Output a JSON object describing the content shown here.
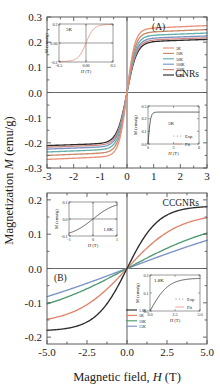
{
  "figure": {
    "xlabel_prefix": "Magnetic field,",
    "xlabel_sym": "H",
    "xlabel_unit": "(T)",
    "ylabel_prefix": "Magnetization",
    "ylabel_sym": "M",
    "ylabel_unit": "(emu/g)"
  },
  "chart_data": [
    {
      "type": "line",
      "panel_label": "(A)",
      "sample_label": "GNRs",
      "xlabel": "Magnetic field, H (T)",
      "ylabel": "Magnetization M (emu/g)",
      "xlim": [
        -3,
        3
      ],
      "ylim": [
        -0.3,
        0.3
      ],
      "xticks": [
        "-3",
        "-2",
        "-1",
        "0",
        "1",
        "2",
        "3"
      ],
      "xtick_values": [
        -3,
        -2,
        -1,
        0,
        1,
        2,
        3
      ],
      "yticks": [
        "0.3",
        "0.2",
        "0.1",
        "0.0",
        "-0.1",
        "-0.2",
        "-0.3"
      ],
      "ytick_values": [
        0.3,
        0.2,
        0.1,
        0.0,
        -0.1,
        -0.2,
        -0.3
      ],
      "grid": false,
      "legend_position": "right-middle",
      "series": [
        {
          "name": "5K",
          "color": "#e8927c",
          "saturation": 0.252,
          "knee": 0.4
        },
        {
          "name": "10K",
          "color": "#c98b6a",
          "saturation": 0.237,
          "knee": 0.42
        },
        {
          "name": "50K",
          "color": "#64b0ac",
          "saturation": 0.224,
          "knee": 0.44
        },
        {
          "name": "100K",
          "color": "#7b93c4",
          "saturation": 0.213,
          "knee": 0.46
        },
        {
          "name": "200K",
          "color": "#d08a84",
          "saturation": 0.206,
          "knee": 0.48
        },
        {
          "name": "300K",
          "color": "#2b2b2b",
          "saturation": 0.2,
          "knee": 0.5
        }
      ],
      "insets": [
        {
          "id": "A-inset-lowfield",
          "type": "line",
          "temperature": "5K",
          "xlabel_sym": "H",
          "xlabel_unit": "(T)",
          "ylabel": "M (emu/g)",
          "xlim": [
            -0.5,
            0.5
          ],
          "ylim": [
            -0.2,
            0.2
          ],
          "xticks": [
            "-0.5",
            "0.00",
            "0.5"
          ],
          "yticks": [
            "0.2",
            "0.00",
            "-0.2"
          ],
          "series": [
            {
              "name": "5K",
              "color": "#e0846c"
            }
          ]
        },
        {
          "id": "A-inset-fit",
          "type": "line",
          "temperature": "5K",
          "xlabel_sym": "H",
          "xlabel_unit": "(T)",
          "ylabel": "M (emu/g)",
          "xlim": [
            0,
            6
          ],
          "ylim": [
            0.0,
            0.3
          ],
          "xticks": [
            "0",
            "3",
            "6"
          ],
          "yticks": [
            "0.3",
            "0.2",
            "0.1",
            "0.0"
          ],
          "legend": [
            {
              "name": "Exp",
              "color": "#6e6e6e",
              "style": "dots"
            },
            {
              "name": "Fit",
              "color": "#e0846c",
              "style": "line"
            }
          ]
        }
      ]
    },
    {
      "type": "line",
      "panel_label": "(B)",
      "sample_label": "CCGNRs",
      "xlabel": "Magnetic field, H (T)",
      "ylabel": "Magnetization M (emu/g)",
      "xlim": [
        -5.0,
        5.0
      ],
      "ylim": [
        -0.22,
        0.22
      ],
      "xticks": [
        "-5.0",
        "-2.5",
        "0.0",
        "2.5",
        "5.0"
      ],
      "xtick_values": [
        -5.0,
        -2.5,
        0.0,
        2.5,
        5.0
      ],
      "yticks": [
        "0.2",
        "0.1",
        "0.0",
        "-0.1",
        "-0.2"
      ],
      "ytick_values": [
        0.2,
        0.1,
        0.0,
        -0.1,
        -0.2
      ],
      "grid": false,
      "legend_position": "bottom-center",
      "series": [
        {
          "name": "1.8K",
          "color": "#2b2b2b",
          "value_at_5T": 0.18,
          "curvature": 1.45
        },
        {
          "name": "5K",
          "color": "#e0846c",
          "value_at_5T": 0.148,
          "curvature": 0.8
        },
        {
          "name": "10K",
          "color": "#4e9a72",
          "value_at_5T": 0.103,
          "curvature": 0.35
        },
        {
          "name": "15K",
          "color": "#7b93c4",
          "value_at_5T": 0.082,
          "curvature": 0.18
        }
      ],
      "insets": [
        {
          "id": "B-inset-lowfield",
          "type": "line",
          "temperature": "1.8K",
          "xlabel_sym": "H",
          "xlabel_unit": "(T)",
          "ylabel": "M (emu/g)",
          "xlim": [
            -1,
            1
          ],
          "ylim": [
            -0.1,
            0.1
          ],
          "xticks": [
            "-1",
            "0",
            "1"
          ],
          "yticks": [
            "0.1",
            "0.0",
            "-0.1"
          ],
          "series": [
            {
              "name": "1.8K",
              "color": "#2b2b2b"
            }
          ]
        },
        {
          "id": "B-inset-fit",
          "type": "line",
          "temperature": "1.8K",
          "xlabel_sym": "H",
          "xlabel_unit": "(T)",
          "ylabel": "M (emu/g)",
          "xlim": [
            0.0,
            5.0
          ],
          "ylim": [
            0.0,
            0.2
          ],
          "xticks": [
            "0.0",
            "2.5",
            "5.0"
          ],
          "yticks": [
            "0.2",
            "0.1",
            "0.0"
          ],
          "legend": [
            {
              "name": "Exp",
              "color": "#6e6e6e",
              "style": "dots"
            },
            {
              "name": "Fit",
              "color": "#e0846c",
              "style": "line"
            }
          ]
        }
      ]
    }
  ]
}
